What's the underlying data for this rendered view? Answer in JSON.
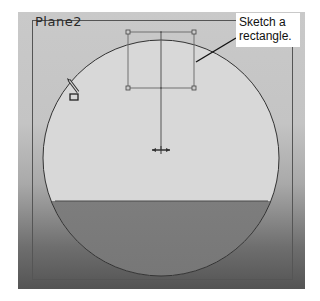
{
  "viewport": {
    "plane_name": "Plane2",
    "background_gradient": [
      "#c9c9c9",
      "#545454"
    ]
  },
  "sketch": {
    "circle": {
      "cx": 161,
      "cy": 158,
      "r": 118,
      "stroke": "#3a3a3a"
    },
    "rectangle": {
      "x1": 128,
      "y1": 32,
      "x2": 194,
      "y2": 88,
      "stroke": "#6a6a6a"
    },
    "centerline": {
      "x": 161,
      "y1": 32,
      "y2": 150
    },
    "origin": {
      "x": 161,
      "y": 150
    },
    "section_line_y": 201
  },
  "callout": {
    "text": "Sketch a rectangle.",
    "line1": "Sketch a",
    "line2": "rectangle."
  },
  "cursor": {
    "icon": "pencil-rectangle-cursor"
  }
}
